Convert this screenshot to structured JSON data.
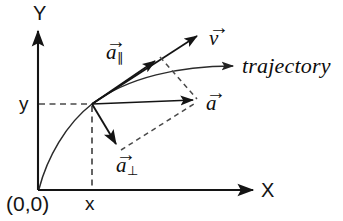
{
  "figure": {
    "background_color": "#ffffff",
    "line_color": "#1a1a1a",
    "dashed_color": "#4d4d4d",
    "curve_color": "#333333"
  },
  "axes": {
    "x_label": "X",
    "y_label": "Y",
    "origin_label": "(0,0)",
    "x_tick_label": "x",
    "y_tick_label": "y",
    "x_axis_y_px": 190,
    "y_axis_x_px": 38,
    "x_axis_end_px": 258,
    "y_axis_end_px": 27
  },
  "point": {
    "name": "particle-position",
    "x_px": 92,
    "y_px": 104
  },
  "vectors": [
    {
      "id": "velocity",
      "label": "v",
      "accent": "→",
      "subscript": "",
      "tip_x_px": 201,
      "tip_y_px": 33,
      "label_x_px": 209,
      "label_y_px": 30,
      "style": "solid"
    },
    {
      "id": "acceleration-parallel",
      "label": "a",
      "accent": "→",
      "subscript": "∥",
      "tip_x_px": 159,
      "tip_y_px": 58,
      "label_x_px": 106,
      "label_y_px": 44,
      "style": "solid"
    },
    {
      "id": "acceleration",
      "label": "a",
      "accent": "→",
      "subscript": "",
      "tip_x_px": 198,
      "tip_y_px": 100,
      "label_x_px": 206,
      "label_y_px": 95,
      "style": "solid"
    },
    {
      "id": "acceleration-perpendicular",
      "label": "a",
      "accent": "→",
      "subscript": "⊥",
      "tip_x_px": 120,
      "tip_y_px": 149,
      "label_x_px": 116,
      "label_y_px": 157,
      "style": "solid"
    }
  ],
  "trajectory": {
    "label": "trajectory",
    "label_x_px": 242,
    "label_y_px": 56,
    "arrow_tip_x_px": 240,
    "arrow_tip_y_px": 66
  },
  "construction_lines": [
    {
      "id": "dashed-y-projection",
      "from": "y-axis",
      "to": "particle-position"
    },
    {
      "id": "dashed-x-projection",
      "from": "x-axis",
      "to": "particle-position"
    },
    {
      "id": "dashed-parallelogram-upper",
      "from": "a-parallel-tip",
      "to": "a-tip"
    },
    {
      "id": "dashed-parallelogram-lower",
      "from": "a-perp-tip",
      "to": "a-tip"
    }
  ]
}
